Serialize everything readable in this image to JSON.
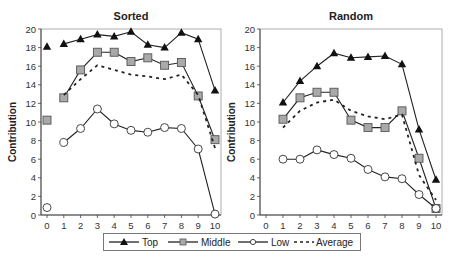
{
  "chart_data": [
    {
      "type": "line",
      "title": "Sorted",
      "xlabel": "Period",
      "ylabel": "Contribution",
      "xlim": [
        0,
        10
      ],
      "ylim": [
        0,
        20
      ],
      "x_ticks": [
        0,
        1,
        2,
        3,
        4,
        5,
        6,
        7,
        8,
        9,
        10
      ],
      "y_ticks": [
        0,
        2,
        4,
        6,
        8,
        10,
        12,
        14,
        16,
        18,
        20
      ],
      "grid": false,
      "x": [
        0,
        1,
        2,
        3,
        4,
        5,
        6,
        7,
        8,
        9,
        10
      ],
      "series": [
        {
          "name": "Top",
          "marker": "triangle-filled",
          "values": [
            18.1,
            18.4,
            18.9,
            19.4,
            19.2,
            19.7,
            18.3,
            18.0,
            19.6,
            18.9,
            13.4
          ]
        },
        {
          "name": "Middle",
          "marker": "square-gray",
          "values": [
            10.2,
            12.6,
            15.6,
            17.5,
            17.5,
            16.5,
            16.9,
            16.1,
            16.4,
            12.8,
            8.1
          ]
        },
        {
          "name": "Low",
          "marker": "circle-open",
          "values": [
            0.8,
            7.8,
            9.3,
            11.4,
            9.8,
            9.1,
            8.9,
            9.4,
            9.3,
            7.1,
            0.1
          ]
        },
        {
          "name": "Average",
          "marker": "none",
          "style": "dashed",
          "values": [
            null,
            12.9,
            14.6,
            16.1,
            15.6,
            15.1,
            14.9,
            14.6,
            15.1,
            12.9,
            7.2
          ]
        }
      ]
    },
    {
      "type": "line",
      "title": "Random",
      "xlabel": "Period",
      "ylabel": "Contribution",
      "xlim": [
        0,
        10
      ],
      "ylim": [
        0,
        20
      ],
      "x_ticks": [
        0,
        1,
        2,
        3,
        4,
        5,
        6,
        7,
        8,
        9,
        10
      ],
      "y_ticks": [
        0,
        2,
        4,
        6,
        8,
        10,
        12,
        14,
        16,
        18,
        20
      ],
      "grid": false,
      "x": [
        1,
        2,
        3,
        4,
        5,
        6,
        7,
        8,
        9,
        10
      ],
      "series": [
        {
          "name": "Top",
          "marker": "triangle-filled",
          "values": [
            12.1,
            14.4,
            16.0,
            17.4,
            16.9,
            17.0,
            17.1,
            16.2,
            9.2,
            3.8
          ]
        },
        {
          "name": "Middle",
          "marker": "square-gray",
          "values": [
            10.3,
            12.6,
            13.2,
            13.2,
            10.2,
            9.4,
            9.4,
            11.2,
            6.1,
            0.7
          ]
        },
        {
          "name": "Low",
          "marker": "circle-open",
          "values": [
            6.0,
            6.0,
            7.0,
            6.5,
            6.1,
            4.9,
            4.1,
            3.9,
            2.2,
            0.7
          ]
        },
        {
          "name": "Average",
          "marker": "none",
          "style": "dashed",
          "values": [
            9.4,
            11.2,
            12.1,
            12.4,
            11.2,
            10.6,
            10.3,
            10.8,
            4.3,
            1.6
          ]
        }
      ]
    }
  ],
  "legend": {
    "position": "bottom",
    "items": [
      {
        "label": "Top"
      },
      {
        "label": "Middle"
      },
      {
        "label": "Low"
      },
      {
        "label": "Average"
      }
    ]
  }
}
